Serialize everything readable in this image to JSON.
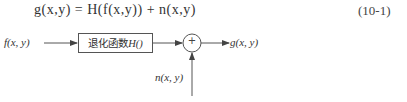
{
  "equation": {
    "text": "g(x,y) = H(f(x,y)) + n(x,y)",
    "number": "(10-1)"
  },
  "diagram": {
    "input_label": "f(x, y)",
    "block_label_cn": "退化函数",
    "block_label_func": "H()",
    "adder_symbol": "+",
    "noise_label": "n(x, y)",
    "output_label": "g(x, y)"
  }
}
